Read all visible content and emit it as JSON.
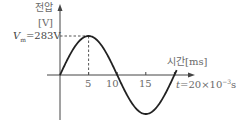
{
  "chart_data": {
    "type": "line",
    "title": "",
    "ylabel_line1": "전압",
    "ylabel_line2": "[V]",
    "xlabel": "시간[ms]",
    "peak_label": "V_m=283V",
    "peak_label_v": "V",
    "peak_label_sub": "m",
    "peak_label_rest": "=283V",
    "period_label": "t=20×10⁻³s",
    "period_label_t": "t",
    "period_label_rest": "=20×10",
    "period_label_exp": "−3",
    "period_label_unit": "s",
    "x_ticks": [
      "5",
      "10",
      "15"
    ],
    "x_tick_values": [
      5,
      10,
      15
    ],
    "xlim": [
      0,
      20
    ],
    "ylim": [
      -283,
      283
    ],
    "amplitude": 283,
    "period_ms": 20,
    "function": "v(t) = 283 sin(2π t / 20ms)",
    "x": [
      0,
      2.5,
      5,
      7.5,
      10,
      12.5,
      15,
      17.5,
      20
    ],
    "values": [
      0,
      200,
      283,
      200,
      0,
      -200,
      -283,
      -200,
      0
    ],
    "grid": false,
    "legend": "none",
    "annotations": [
      "dashed line from V_m to peak at t=5",
      "dashed line from peak down to x-axis at t=5"
    ],
    "colors": {
      "curve": "#222222",
      "axis": "#444444",
      "dashed": "#555555",
      "text": "#6a6a6a"
    }
  }
}
